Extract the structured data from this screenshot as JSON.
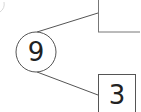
{
  "diagram": {
    "type": "factor-tree-fragment",
    "root": {
      "value": "9",
      "shape": "circle"
    },
    "children": [
      {
        "value": "",
        "shape": "box",
        "position": "upper"
      },
      {
        "value": "3",
        "shape": "box",
        "position": "lower"
      }
    ],
    "colors": {
      "stroke": "#555555",
      "text": "#222222",
      "background": "#ffffff"
    }
  }
}
